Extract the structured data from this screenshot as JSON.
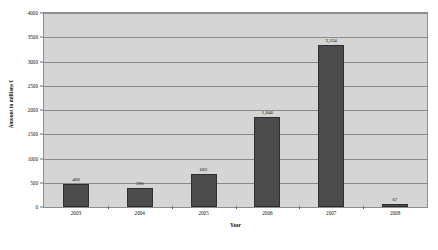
{
  "chart_data": {
    "type": "bar",
    "title": "",
    "xlabel": "Year",
    "ylabel": "Amount in millions €",
    "categories": [
      "2003",
      "2004",
      "2005",
      "2006",
      "2007",
      "2008"
    ],
    "values": [
      468,
      390,
      683,
      1846,
      3334,
      67
    ],
    "value_labels": [
      "468",
      "390",
      "683",
      "1,846",
      "3,334",
      "67"
    ],
    "ylim": [
      0,
      4000
    ],
    "ytick_labels": [
      "0",
      "500",
      "1000",
      "1500",
      "2000",
      "2500",
      "3000",
      "3500",
      "4000"
    ],
    "ytick_values": [
      0,
      500,
      1000,
      1500,
      2000,
      2500,
      3000,
      3500,
      4000
    ],
    "grid": true,
    "legend": "none",
    "series": [
      {
        "name": "Amount",
        "values": [
          468,
          390,
          683,
          1846,
          3334,
          67
        ]
      }
    ],
    "colors": {
      "bar_fill": "#4b4b4b",
      "bar_border": "#2e2e2e",
      "plot_background": "#d5d5d5",
      "gridline": "#8a8a8a",
      "frame": "#8d8d8d",
      "text": "#111111",
      "page_background": "#ffffff"
    }
  }
}
